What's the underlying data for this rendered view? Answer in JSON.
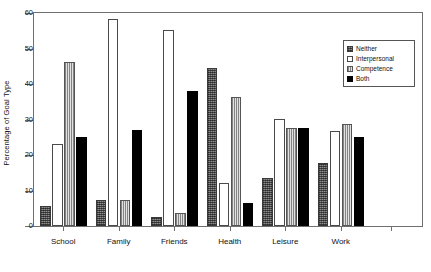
{
  "chart_data": {
    "type": "bar",
    "title": "",
    "subtitle": "",
    "xlabel": "",
    "ylabel": "Percentage of Goal Type",
    "ylim": [
      0,
      60
    ],
    "yticks": [
      0,
      10,
      20,
      30,
      40,
      50,
      60
    ],
    "ytick_labels": [
      "0",
      "10",
      "20",
      "30",
      "40",
      "50",
      "60"
    ],
    "grid": false,
    "legend_position": "top-right",
    "categories": [
      "School",
      "Family",
      "Friends",
      "Health",
      "Leisure",
      "Work"
    ],
    "series": [
      {
        "name": "Neither",
        "fill": "dark-gray-hatch",
        "color": "#8d8d8d",
        "values": [
          5.5,
          7.4,
          2.5,
          44.4,
          13.6,
          17.8
        ]
      },
      {
        "name": "Interpersonal",
        "fill": "white-outline",
        "color": "#ffffff",
        "values": [
          23.1,
          58.3,
          55.1,
          12.0,
          30.2,
          26.8
        ]
      },
      {
        "name": "Competence",
        "fill": "light-gray-stripe",
        "color": "#bdbdbd",
        "values": [
          46.3,
          7.3,
          3.8,
          36.3,
          27.5,
          28.7
        ]
      },
      {
        "name": "Both",
        "fill": "solid-black",
        "color": "#000000",
        "values": [
          25.0,
          27.0,
          38.1,
          6.6,
          27.5,
          25.0
        ]
      }
    ]
  },
  "figure": {
    "background": "#ffffff",
    "frame_color": "#6f6f6f"
  }
}
